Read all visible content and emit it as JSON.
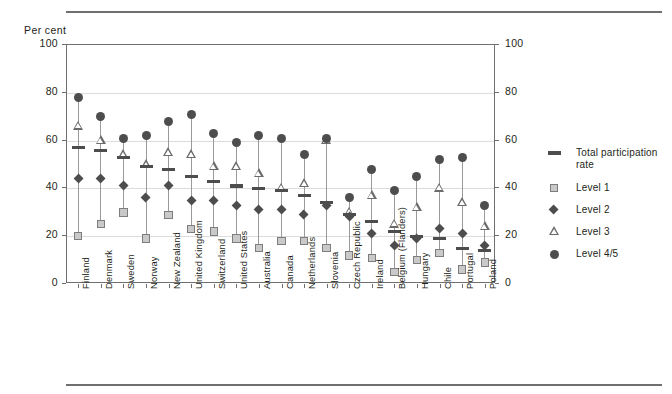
{
  "axis": {
    "unit_label": "Per cent",
    "yticks": [
      0,
      20,
      40,
      60,
      80,
      100
    ],
    "ylim": [
      0,
      100
    ]
  },
  "legend": {
    "items": [
      {
        "label": "Total participation rate",
        "symbol": "dash",
        "color": "#4d4d4d"
      },
      {
        "label": "Level 1",
        "symbol": "square",
        "color": "#c9c9c9"
      },
      {
        "label": "Level 2",
        "symbol": "diamond",
        "color": "#4d4d4d"
      },
      {
        "label": "Level 3",
        "symbol": "triangle",
        "color": "#6b6b6b"
      },
      {
        "label": "Level 4/5",
        "symbol": "circle",
        "color": "#4d4d4d"
      }
    ]
  },
  "chart_data": {
    "type": "scatter",
    "title": "",
    "subtitle": "",
    "xlabel": "",
    "ylabel": "Per cent",
    "ylim": [
      0,
      100
    ],
    "yticks": [
      0,
      20,
      40,
      60,
      80,
      100
    ],
    "grid": true,
    "legend_position": "right",
    "categories": [
      "Finland",
      "Denmark",
      "Sweden",
      "Norway",
      "New Zealand",
      "United Kingdom",
      "Switzerland",
      "United States",
      "Australia",
      "Canada",
      "Netherlands",
      "Slovenia",
      "Czech Republic",
      "Ireland",
      "Belgium (Flanders)",
      "Hungary",
      "Chile",
      "Portugal",
      "Poland"
    ],
    "series": [
      {
        "name": "Total participation rate",
        "symbol": "dash",
        "values": [
          57,
          56,
          53,
          49,
          48,
          45,
          43,
          41,
          40,
          39,
          37,
          34,
          29,
          26,
          22,
          20,
          19,
          15,
          14
        ]
      },
      {
        "name": "Level 1",
        "symbol": "square",
        "values": [
          20,
          25,
          30,
          19,
          29,
          23,
          22,
          19,
          15,
          18,
          18,
          15,
          12,
          11,
          5,
          10,
          13,
          6,
          9
        ]
      },
      {
        "name": "Level 2",
        "symbol": "diamond",
        "values": [
          44,
          44,
          41,
          36,
          41,
          35,
          35,
          33,
          31,
          31,
          29,
          33,
          28,
          21,
          16,
          19,
          23,
          21,
          16
        ]
      },
      {
        "name": "Level 3",
        "symbol": "triangle",
        "values": [
          66,
          60,
          54,
          50,
          55,
          54,
          49,
          49,
          46,
          40,
          42,
          60,
          30,
          37,
          25,
          32,
          40,
          34,
          24
        ]
      },
      {
        "name": "Level 4/5",
        "symbol": "circle",
        "values": [
          78,
          70,
          61,
          62,
          68,
          71,
          63,
          59,
          62,
          61,
          54,
          61,
          36,
          48,
          39,
          45,
          52,
          53,
          33
        ]
      }
    ]
  }
}
